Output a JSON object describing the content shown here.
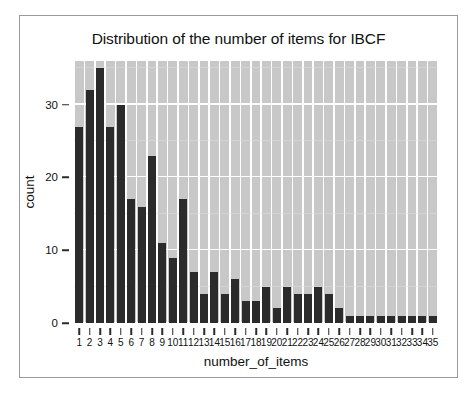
{
  "figure": {
    "background_color": "#ffffff",
    "frame_color": "#9a9a9a",
    "panel_color": "#c8c8c8",
    "bar_color": "#2b2b2b",
    "grid_color": "#ffffff"
  },
  "chart_data": {
    "type": "bar",
    "title": "Distribution of the number of items for IBCF",
    "xlabel": "number_of_items",
    "ylabel": "count",
    "categories": [
      "1",
      "2",
      "3",
      "4",
      "5",
      "6",
      "7",
      "8",
      "9",
      "10",
      "11",
      "12",
      "13",
      "14",
      "15",
      "16",
      "17",
      "18",
      "19",
      "20",
      "21",
      "22",
      "23",
      "24",
      "25",
      "26",
      "27",
      "28",
      "29",
      "30",
      "31",
      "32",
      "33",
      "34",
      "35"
    ],
    "values": [
      27,
      32,
      35,
      27,
      30,
      17,
      16,
      23,
      11,
      9,
      17,
      7,
      4,
      7,
      4,
      6,
      3,
      3,
      5,
      2,
      5,
      4,
      4,
      5,
      4,
      2,
      1,
      1,
      1,
      1,
      1,
      1,
      1,
      1,
      1
    ],
    "ylim": [
      0,
      36
    ],
    "yticks": [
      0,
      10,
      20,
      30
    ],
    "ytick_labels": [
      "0",
      "10",
      "20",
      "30"
    ],
    "grid": true,
    "legend": "none",
    "series_name": "count"
  }
}
